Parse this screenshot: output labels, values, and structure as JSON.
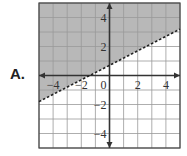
{
  "option_label": "A.",
  "chart_data": {
    "type": "line",
    "title": "",
    "xlabel": "",
    "ylabel": "",
    "xlim": [
      -5,
      5
    ],
    "ylim": [
      -5,
      5
    ],
    "grid": true,
    "x_tick_labels": [
      "-4",
      "-2",
      "0",
      "2",
      "4"
    ],
    "y_tick_labels": [
      "4",
      "2",
      "-2",
      "-4"
    ],
    "boundary_line": {
      "slope": 0.5,
      "intercept": 0.7,
      "style": "dashed"
    },
    "shaded_region": "above",
    "inequality": "y > 0.5x + 0.7",
    "colors": {
      "shade": "#b8b8b8",
      "grid": "#999999",
      "axis": "#333333"
    }
  }
}
